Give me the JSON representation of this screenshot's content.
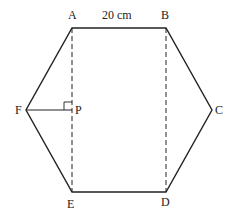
{
  "diagram": {
    "vertices": {
      "A": {
        "label": "A",
        "x": 72,
        "y": 28
      },
      "B": {
        "label": "B",
        "x": 166,
        "y": 28
      },
      "C": {
        "label": "C",
        "x": 212,
        "y": 110
      },
      "D": {
        "label": "D",
        "x": 166,
        "y": 192
      },
      "E": {
        "label": "E",
        "x": 72,
        "y": 192
      },
      "F": {
        "label": "F",
        "x": 26,
        "y": 110
      },
      "P": {
        "label": "P",
        "x": 72,
        "y": 110
      }
    },
    "side_label": "20 cm",
    "edges": [
      "AB",
      "BC",
      "CD",
      "DE",
      "EF",
      "FA",
      "FP"
    ],
    "dashed": [
      "AE",
      "BD"
    ],
    "right_angle_at": "P",
    "line_color": "#222222"
  }
}
